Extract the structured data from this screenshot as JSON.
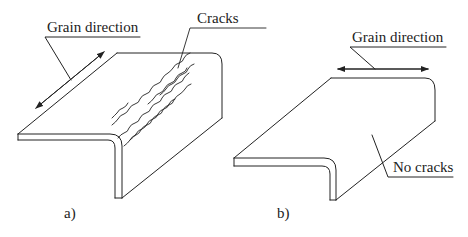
{
  "figure": {
    "panel_a": {
      "caption": "a)",
      "labels": {
        "grain_direction": "Grain direction",
        "cracks": "Cracks"
      },
      "grain_orientation": "parallel to bend line"
    },
    "panel_b": {
      "caption": "b)",
      "labels": {
        "grain_direction": "Grain direction",
        "no_cracks": "No cracks"
      },
      "grain_orientation": "perpendicular to bend line"
    },
    "colors": {
      "line": "#222222",
      "background": "#ffffff"
    }
  }
}
